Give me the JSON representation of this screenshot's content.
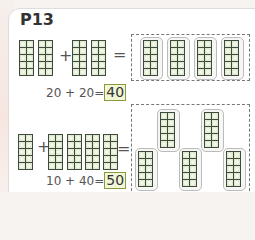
{
  "page": {
    "title": "P13"
  },
  "problems": [
    {
      "addend1": 20,
      "addend2": 20,
      "plus": "+",
      "equals": "=",
      "equation": "20 + 20=",
      "answer": "40",
      "left_rods": 2,
      "right_rods": 2,
      "result_rods": 4
    },
    {
      "addend1": 10,
      "addend2": 40,
      "plus": "+",
      "equals": "=",
      "equation": "10 + 40=",
      "answer": "50",
      "left_rods": 1,
      "right_rods": 4,
      "result_rods": 5
    }
  ],
  "colors": {
    "rod_fill": "#dfead0",
    "rod_border": "#3d4a3d",
    "answer_border": "#8a9a3a"
  }
}
